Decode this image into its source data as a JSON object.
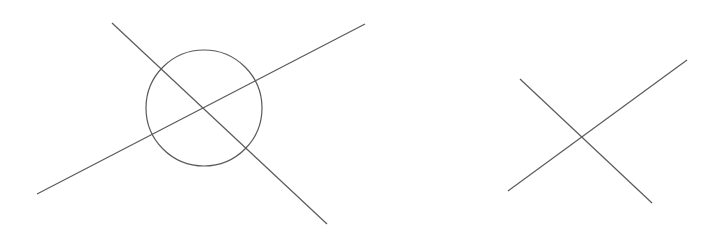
{
  "diagram": {
    "background": "#ffffff",
    "stroke": "#5a5a5a",
    "stroke_width": 1.2,
    "figures": [
      {
        "name": "circle-with-intersecting-lines",
        "lines": [
          {
            "x1": 37,
            "y1": 194,
            "x2": 365,
            "y2": 24
          },
          {
            "x1": 112,
            "y1": 23,
            "x2": 327,
            "y2": 224
          }
        ],
        "circle": {
          "cx": 204,
          "cy": 108,
          "r": 58
        }
      },
      {
        "name": "intersecting-lines",
        "lines": [
          {
            "x1": 508,
            "y1": 191,
            "x2": 687,
            "y2": 60
          },
          {
            "x1": 520,
            "y1": 79,
            "x2": 652,
            "y2": 203
          }
        ]
      }
    ]
  }
}
